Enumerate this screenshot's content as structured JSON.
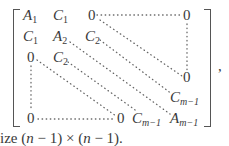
{
  "matrix": {
    "entries": [
      {
        "id": "a1",
        "base": "A",
        "sub": "1",
        "x": 23,
        "y": 8
      },
      {
        "id": "c1a",
        "base": "C",
        "sub": "1",
        "x": 53,
        "y": 8
      },
      {
        "id": "z1",
        "base": "0",
        "sub": "",
        "x": 88,
        "y": 8
      },
      {
        "id": "z1r",
        "base": "0",
        "sub": "",
        "x": 183,
        "y": 8
      },
      {
        "id": "c1b",
        "base": "C",
        "sub": "1",
        "x": 23,
        "y": 29
      },
      {
        "id": "a2",
        "base": "A",
        "sub": "2",
        "x": 53,
        "y": 29
      },
      {
        "id": "c2a",
        "base": "C",
        "sub": "2",
        "x": 85,
        "y": 29
      },
      {
        "id": "z3",
        "base": "0",
        "sub": "",
        "x": 27,
        "y": 50
      },
      {
        "id": "c2b",
        "base": "C",
        "sub": "2",
        "x": 53,
        "y": 50
      },
      {
        "id": "zr",
        "base": "0",
        "sub": "",
        "x": 183,
        "y": 70
      },
      {
        "id": "cm1a",
        "base": "C",
        "sub": "m−1",
        "x": 170,
        "y": 90
      },
      {
        "id": "zb1",
        "base": "0",
        "sub": "",
        "x": 27,
        "y": 111
      },
      {
        "id": "zb2",
        "base": "0",
        "sub": "",
        "x": 117,
        "y": 111
      },
      {
        "id": "cm1b",
        "base": "C",
        "sub": "m−1",
        "x": 132,
        "y": 111
      },
      {
        "id": "am1",
        "base": "A",
        "sub": "m−1",
        "x": 170,
        "y": 111
      }
    ],
    "trailing_punct": ","
  },
  "caption": {
    "prefix": "ize (",
    "n1": "n",
    "mid1": " − 1) × (",
    "n2": "n",
    "suffix": " − 1)."
  }
}
